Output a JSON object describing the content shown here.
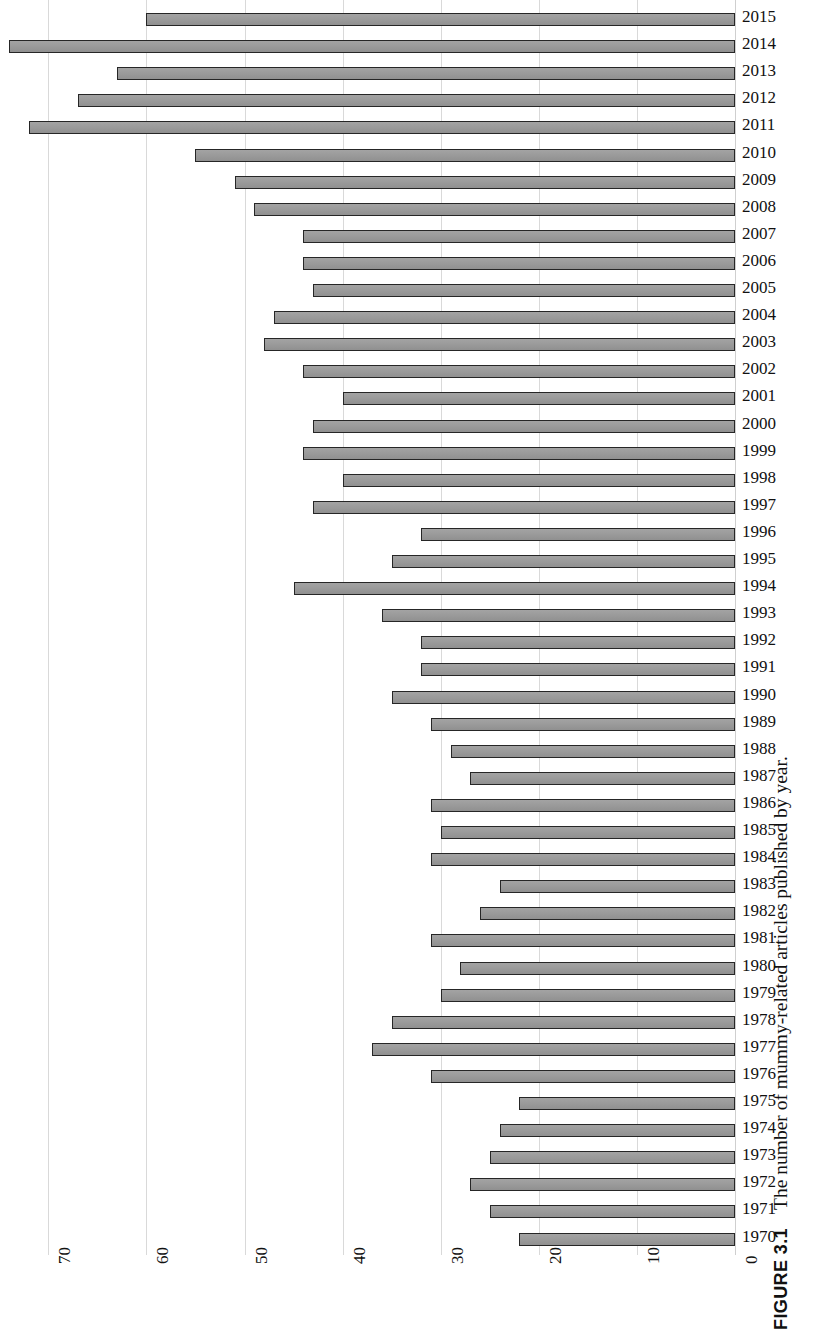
{
  "figure": {
    "number_label": "FIGURE 3.1",
    "caption_text": "The number of mummy-related articles published by year."
  },
  "chart_data": {
    "type": "bar",
    "orientation": "horizontal",
    "title": "",
    "xlabel": "",
    "ylabel": "",
    "grid": true,
    "legend": false,
    "xlim": [
      0,
      70
    ],
    "x_axis_reversed": true,
    "xticks": [
      "70",
      "60",
      "50",
      "40",
      "30",
      "20",
      "10",
      "0"
    ],
    "xtick_values": [
      70,
      60,
      50,
      40,
      30,
      20,
      10,
      0
    ],
    "categories": [
      "2015",
      "2014",
      "2013",
      "2012",
      "2011",
      "2010",
      "2009",
      "2008",
      "2007",
      "2006",
      "2005",
      "2004",
      "2003",
      "2002",
      "2001",
      "2000",
      "1999",
      "1998",
      "1997",
      "1996",
      "1995",
      "1994",
      "1993",
      "1992",
      "1991",
      "1990",
      "1989",
      "1988",
      "1987",
      "1986",
      "1985",
      "1984",
      "1983",
      "1982",
      "1981",
      "1980",
      "1979",
      "1978",
      "1977",
      "1976",
      "1975",
      "1974",
      "1973",
      "1972",
      "1971",
      "1970"
    ],
    "values": [
      60,
      74,
      63,
      67,
      72,
      55,
      51,
      49,
      44,
      44,
      43,
      47,
      48,
      44,
      40,
      43,
      44,
      40,
      43,
      32,
      35,
      45,
      36,
      32,
      32,
      35,
      31,
      29,
      27,
      31,
      30,
      31,
      24,
      26,
      31,
      28,
      30,
      35,
      37,
      31,
      22,
      24,
      25,
      27,
      25,
      22
    ],
    "bar_color": "#9a9a9a",
    "bar_edge_color": "#262626",
    "gridline_color": "#d9d9d9"
  }
}
